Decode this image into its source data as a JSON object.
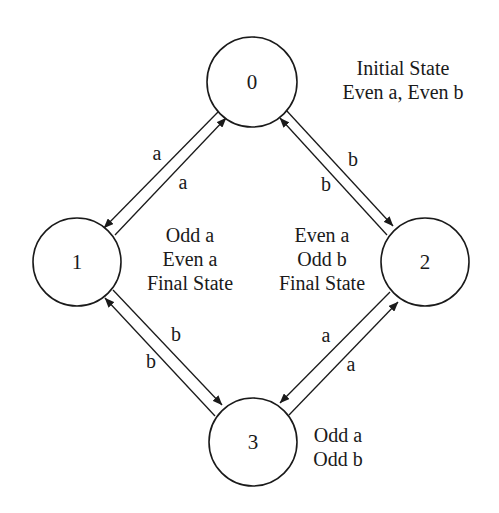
{
  "diagram": {
    "type": "state_machine",
    "states": [
      {
        "id": "0",
        "label": "0",
        "cx": 252,
        "cy": 82,
        "r": 45,
        "note": [
          "Initial State",
          "Even a, Even b"
        ],
        "note_x": 403,
        "note_y": [
          75,
          99
        ],
        "note_anchor": "middle"
      },
      {
        "id": "1",
        "label": "1",
        "cx": 77,
        "cy": 262,
        "r": 44,
        "note": [
          "Odd a",
          "Even a",
          "Final State"
        ],
        "note_x": 190,
        "note_y": [
          242,
          266,
          290
        ],
        "note_anchor": "middle"
      },
      {
        "id": "2",
        "label": "2",
        "cx": 425,
        "cy": 262,
        "r": 44,
        "note": [
          "Even a",
          "Odd b",
          "Final State"
        ],
        "note_x": 322,
        "note_y": [
          242,
          266,
          290
        ],
        "note_anchor": "middle"
      },
      {
        "id": "3",
        "label": "3",
        "cx": 253,
        "cy": 442,
        "r": 44,
        "note": [
          "Odd a",
          "Odd b"
        ],
        "note_x": 338,
        "note_y": [
          442,
          466
        ],
        "note_anchor": "middle"
      }
    ],
    "transitions": [
      {
        "from": "0",
        "to": "1",
        "symbol": "a",
        "x1": 218,
        "y1": 112,
        "x2": 104,
        "y2": 228,
        "lx": 157,
        "ly": 160
      },
      {
        "from": "1",
        "to": "0",
        "symbol": "a",
        "x1": 115,
        "y1": 235,
        "x2": 226,
        "y2": 118,
        "lx": 183,
        "ly": 189
      },
      {
        "from": "0",
        "to": "2",
        "symbol": "b",
        "x1": 286,
        "y1": 110,
        "x2": 393,
        "y2": 226,
        "lx": 353,
        "ly": 166
      },
      {
        "from": "2",
        "to": "0",
        "symbol": "b",
        "x1": 387,
        "y1": 235,
        "x2": 280,
        "y2": 118,
        "lx": 326,
        "ly": 191
      },
      {
        "from": "1",
        "to": "3",
        "symbol": "b",
        "x1": 113,
        "y1": 290,
        "x2": 222,
        "y2": 405,
        "lx": 176,
        "ly": 341
      },
      {
        "from": "3",
        "to": "1",
        "symbol": "b",
        "x1": 215,
        "y1": 416,
        "x2": 105,
        "y2": 298,
        "lx": 151,
        "ly": 368
      },
      {
        "from": "2",
        "to": "3",
        "symbol": "a",
        "x1": 390,
        "y1": 292,
        "x2": 280,
        "y2": 403,
        "lx": 326,
        "ly": 342
      },
      {
        "from": "3",
        "to": "2",
        "symbol": "a",
        "x1": 289,
        "y1": 415,
        "x2": 398,
        "y2": 302,
        "lx": 351,
        "ly": 371
      }
    ]
  }
}
